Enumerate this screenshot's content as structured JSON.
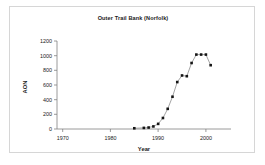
{
  "chart_data": {
    "type": "line",
    "title": "Outer Trail Bank (Norfolk)",
    "xlabel": "Year",
    "ylabel": "AON",
    "xlim": [
      1970,
      2005
    ],
    "ylim": [
      0,
      1200
    ],
    "xticks": [
      1970,
      1980,
      1990,
      2000
    ],
    "yticks": [
      0,
      200,
      400,
      600,
      800,
      1000,
      1200
    ],
    "grid": false,
    "legend": null,
    "marker": "square",
    "marker_color": "#151515",
    "line_color": "#9a9a9a",
    "x": [
      1985,
      1987,
      1988,
      1989,
      1990,
      1991,
      1992,
      1993,
      1994,
      1995,
      1996,
      1997,
      1998,
      1999,
      2000,
      2001
    ],
    "values": [
      10,
      15,
      20,
      35,
      70,
      150,
      275,
      440,
      640,
      730,
      720,
      900,
      1015,
      1015,
      1015,
      870
    ],
    "series": [
      {
        "name": "AON",
        "values": [
          10,
          15,
          20,
          35,
          70,
          150,
          275,
          440,
          640,
          730,
          720,
          900,
          1015,
          1015,
          1015,
          870
        ]
      }
    ]
  },
  "frame": {
    "border_color": "#d6d6d6",
    "background": "#ffffff"
  }
}
